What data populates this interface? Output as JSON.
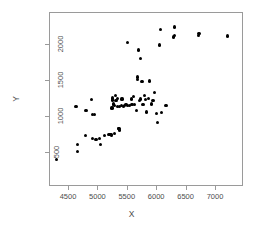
{
  "chart_data": {
    "type": "scatter",
    "title": "",
    "xlabel": "X",
    "ylabel": "Y",
    "xlim": [
      4250,
      7300
    ],
    "ylim": [
      370,
      2250
    ],
    "xticks": [
      4500,
      5000,
      5500,
      6000,
      6500,
      7000
    ],
    "yticks": [
      500,
      1000,
      1500,
      2000
    ],
    "xtick_labels": [
      "4500",
      "5000",
      "5500",
      "6000",
      "6500",
      "7000"
    ],
    "ytick_labels": [
      "500",
      "1000",
      "1500",
      "2000"
    ],
    "grid": false,
    "legend": null,
    "marker": "filled-circle",
    "marker_color": "#000000",
    "n_points": 73,
    "points": [
      [
        4290,
        405
      ],
      [
        4640,
        525
      ],
      [
        4640,
        615
      ],
      [
        4620,
        1150
      ],
      [
        4780,
        745
      ],
      [
        4790,
        1090
      ],
      [
        4880,
        1240
      ],
      [
        4900,
        700
      ],
      [
        4905,
        1040
      ],
      [
        4935,
        1040
      ],
      [
        4960,
        685
      ],
      [
        5020,
        700
      ],
      [
        5040,
        615
      ],
      [
        5110,
        740
      ],
      [
        5180,
        755
      ],
      [
        5200,
        755
      ],
      [
        5215,
        760
      ],
      [
        5225,
        745
      ],
      [
        5230,
        1125
      ],
      [
        5240,
        1235
      ],
      [
        5245,
        1265
      ],
      [
        5250,
        1180
      ],
      [
        5260,
        1170
      ],
      [
        5270,
        770
      ],
      [
        5275,
        1160
      ],
      [
        5290,
        1300
      ],
      [
        5300,
        1230
      ],
      [
        5320,
        1255
      ],
      [
        5330,
        1150
      ],
      [
        5340,
        840
      ],
      [
        5350,
        845
      ],
      [
        5355,
        820
      ],
      [
        5360,
        1150
      ],
      [
        5390,
        1155
      ],
      [
        5400,
        1250
      ],
      [
        5420,
        1150
      ],
      [
        5440,
        1155
      ],
      [
        5470,
        1170
      ],
      [
        5490,
        2030
      ],
      [
        5500,
        1155
      ],
      [
        5530,
        1160
      ],
      [
        5560,
        1250
      ],
      [
        5570,
        1175
      ],
      [
        5600,
        1290
      ],
      [
        5620,
        1175
      ],
      [
        5650,
        1090
      ],
      [
        5660,
        1520
      ],
      [
        5670,
        1555
      ],
      [
        5680,
        1930
      ],
      [
        5700,
        1230
      ],
      [
        5710,
        1250
      ],
      [
        5720,
        1810
      ],
      [
        5740,
        1490
      ],
      [
        5760,
        1175
      ],
      [
        5790,
        1300
      ],
      [
        5800,
        1245
      ],
      [
        5820,
        1070
      ],
      [
        5850,
        1260
      ],
      [
        5870,
        1500
      ],
      [
        5900,
        1180
      ],
      [
        5930,
        1225
      ],
      [
        5960,
        1340
      ],
      [
        5990,
        1050
      ],
      [
        6010,
        925
      ],
      [
        6040,
        2000
      ],
      [
        6060,
        2220
      ],
      [
        6080,
        1060
      ],
      [
        6150,
        1155
      ],
      [
        6280,
        2110
      ],
      [
        6290,
        2250
      ],
      [
        6295,
        2130
      ],
      [
        6700,
        2130
      ],
      [
        6710,
        2155
      ],
      [
        7190,
        2125
      ]
    ]
  },
  "axes": {
    "x_axis_name": "x-axis",
    "y_axis_name": "y-axis"
  }
}
